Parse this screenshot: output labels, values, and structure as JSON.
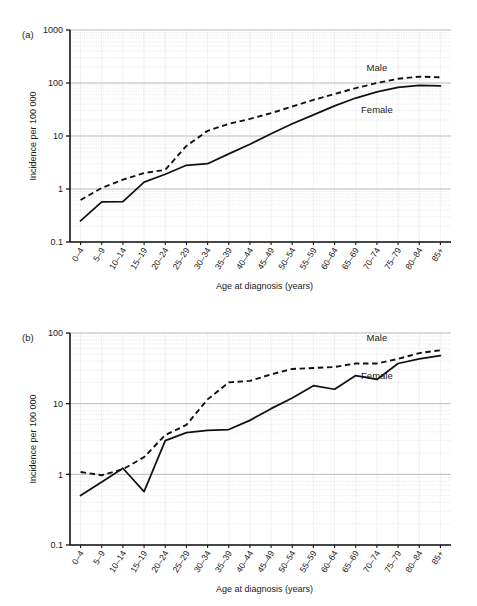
{
  "figure": {
    "panels": [
      {
        "id": "a",
        "panel_label": "(a)",
        "chart_data": {
          "type": "line",
          "title": "",
          "xlabel": "Age at diagnosis (years)",
          "ylabel": "Incidence per 100 000",
          "yscale": "log",
          "ylim": [
            0.1,
            1000
          ],
          "ytick_labels": [
            "0.1",
            "1",
            "10",
            "100",
            "1000"
          ],
          "ytick_values": [
            0.1,
            1,
            10,
            100,
            1000
          ],
          "grid": true,
          "legend_position": "inline-annotation",
          "categories": [
            "0–4",
            "5–9",
            "10–14",
            "15–19",
            "20–24",
            "25–29",
            "30–34",
            "35–39",
            "40–44",
            "45–49",
            "50–54",
            "55–59",
            "60–64",
            "65–69",
            "70–74",
            "75–79",
            "80–84",
            "85+"
          ],
          "series": [
            {
              "name": "Male",
              "style": "dashed",
              "values": [
                0.62,
                1.05,
                1.5,
                2.0,
                2.3,
                6.5,
                12.5,
                17.0,
                21.0,
                27.0,
                36.0,
                48.0,
                62.0,
                80.0,
                100.0,
                120.0,
                132.0,
                128.0
              ]
            },
            {
              "name": "Female",
              "style": "solid",
              "values": [
                0.25,
                0.57,
                0.58,
                1.35,
                1.9,
                2.8,
                3.0,
                4.6,
                7.0,
                11.0,
                17.0,
                25.0,
                37.0,
                52.0,
                68.0,
                83.0,
                90.0,
                88.0
              ]
            }
          ],
          "annotations": [
            {
              "text": "Male",
              "category": "70–74",
              "value": 165
            },
            {
              "text": "Female",
              "category": "70–74",
              "value": 27
            }
          ]
        }
      },
      {
        "id": "b",
        "panel_label": "(b)",
        "chart_data": {
          "type": "line",
          "title": "",
          "xlabel": "Age at diagnosis (years)",
          "ylabel": "Incidence per 100 000",
          "yscale": "log",
          "ylim": [
            0.1,
            100
          ],
          "ytick_labels": [
            "0.1",
            "1",
            "10",
            "100"
          ],
          "ytick_values": [
            0.1,
            1,
            10,
            100
          ],
          "grid": true,
          "legend_position": "inline-annotation",
          "categories": [
            "0–4",
            "5–9",
            "10–14",
            "15–19",
            "20–24",
            "25–29",
            "30–34",
            "35–39",
            "40–44",
            "45–49",
            "50–54",
            "55–59",
            "60–64",
            "65–69",
            "70–74",
            "75–79",
            "80–84",
            "85+"
          ],
          "series": [
            {
              "name": "Male",
              "style": "dashed",
              "values": [
                1.08,
                0.97,
                1.18,
                1.75,
                3.6,
                5.0,
                11.5,
                20.0,
                21.0,
                26.0,
                31.0,
                32.0,
                33.0,
                37.0,
                37.0,
                43.0,
                52.0,
                57.0
              ]
            },
            {
              "name": "Female",
              "style": "solid",
              "values": [
                0.5,
                0.78,
                1.22,
                0.57,
                3.0,
                3.9,
                4.2,
                4.3,
                5.8,
                8.5,
                12.0,
                18.0,
                16.0,
                25.0,
                22.0,
                37.0,
                43.0,
                48.0
              ]
            }
          ],
          "annotations": [
            {
              "text": "Male",
              "category": "70–74",
              "value": 78
            },
            {
              "text": "Female",
              "category": "70–74",
              "value": 22
            }
          ]
        }
      }
    ]
  }
}
